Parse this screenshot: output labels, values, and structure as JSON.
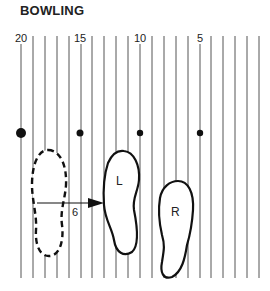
{
  "title": "BOWLING",
  "board_labels": [
    {
      "text": "20",
      "x": 21
    },
    {
      "text": "15",
      "x": 80
    },
    {
      "text": "10",
      "x": 140
    },
    {
      "text": "5",
      "x": 200
    }
  ],
  "boards": {
    "count": 21,
    "start_x": 21,
    "spacing": 11.9,
    "top": 36,
    "bottom": 278
  },
  "dots": [
    {
      "x": 21,
      "r": 5
    },
    {
      "x": 80,
      "r": 3.5
    },
    {
      "x": 140,
      "r": 3.2
    },
    {
      "x": 200,
      "r": 3.2
    }
  ],
  "dots_y": 133,
  "arrow_label": "6",
  "left_foot_label": "L",
  "right_foot_label": "R",
  "colors": {
    "ink": "#111111",
    "line": "#555555"
  }
}
